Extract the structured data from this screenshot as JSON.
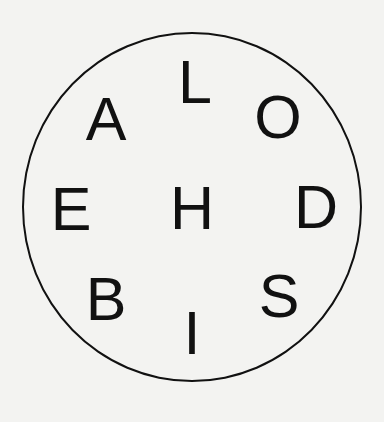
{
  "diagram": {
    "shape": "circle",
    "letters": [
      {
        "char": "L",
        "x": 195,
        "y": 82
      },
      {
        "char": "A",
        "x": 106,
        "y": 119
      },
      {
        "char": "O",
        "x": 278,
        "y": 117
      },
      {
        "char": "E",
        "x": 71,
        "y": 209
      },
      {
        "char": "H",
        "x": 192,
        "y": 208
      },
      {
        "char": "D",
        "x": 316,
        "y": 207
      },
      {
        "char": "B",
        "x": 106,
        "y": 299
      },
      {
        "char": "S",
        "x": 279,
        "y": 296
      },
      {
        "char": "I",
        "x": 192,
        "y": 333
      }
    ]
  }
}
